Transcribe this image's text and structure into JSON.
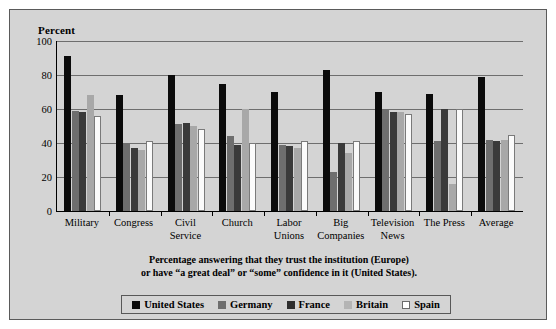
{
  "figure": {
    "axis_title": "Percent",
    "caption_line1": "Percentage answering that they trust the institution (Europe)",
    "caption_line2": "or have “a great deal” or “some” confidence in it (United States)."
  },
  "colors": {
    "background": "#d4d4d4",
    "page": "#ffffff",
    "frame": "#5a5a5a",
    "axis": "#000000",
    "gridline": "#6e6e6e",
    "united_states": "#0b0b0b",
    "germany": "#6e6e6e",
    "france": "#3a3a3a",
    "britain": "#a8a8a8",
    "spain": "#ffffff"
  },
  "chart_data": {
    "type": "bar",
    "title": "",
    "subtitle": "",
    "xlabel": "",
    "ylabel": "Percent",
    "ylim": [
      0,
      100
    ],
    "yticks": [
      0,
      20,
      40,
      60,
      80,
      100
    ],
    "grid": true,
    "legend_position": "bottom",
    "categories": [
      "Military",
      "Congress",
      "Civil Service",
      "Church",
      "Labor Unions",
      "Big Companies",
      "Television News",
      "The Press",
      "Average"
    ],
    "category_labels": [
      "Military",
      "Congress",
      "Civil\nService",
      "Church",
      "Labor\nUnions",
      "Big\nCompanies",
      "Television\nNews",
      "The Press",
      "Average"
    ],
    "series": [
      {
        "name": "United States",
        "color": "#0b0b0b",
        "values": [
          91,
          68,
          80,
          75,
          70,
          83,
          70,
          69,
          79
        ]
      },
      {
        "name": "Germany",
        "color": "#6e6e6e",
        "values": [
          59,
          40,
          51,
          44,
          39,
          23,
          60,
          41,
          42
        ]
      },
      {
        "name": "France",
        "color": "#3a3a3a",
        "values": [
          58,
          37,
          52,
          39,
          38,
          40,
          58,
          60,
          41
        ]
      },
      {
        "name": "Britain",
        "color": "#a8a8a8",
        "values": [
          68,
          36,
          50,
          60,
          37,
          34,
          58,
          16,
          42
        ]
      },
      {
        "name": "Spain",
        "color": "#ffffff",
        "values": [
          56,
          41,
          48,
          40,
          41,
          41,
          57,
          60,
          45
        ]
      }
    ],
    "annotations": [
      "Percentage answering that they trust the institution (Europe)",
      "or have “a great deal” or “some” confidence in it (United States)."
    ]
  }
}
